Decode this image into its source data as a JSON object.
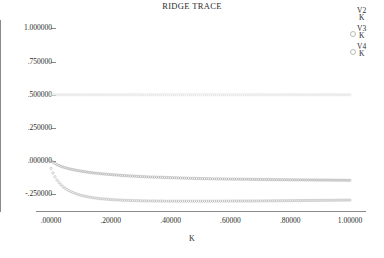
{
  "chart_data": {
    "type": "scatter",
    "title": "RIDGE TRACE",
    "xlabel": "K",
    "ylabel": "",
    "xlim": [
      0.0,
      1.0
    ],
    "ylim": [
      -0.375,
      1.0625
    ],
    "grid": false,
    "legend_position": "top-right",
    "xticks": [
      {
        "value": 0.0,
        "label": ".00000"
      },
      {
        "value": 0.2,
        "label": ".20000"
      },
      {
        "value": 0.4,
        "label": ".40000"
      },
      {
        "value": 0.6,
        "label": ".60000"
      },
      {
        "value": 0.8,
        "label": ".80000"
      },
      {
        "value": 1.0,
        "label": "1.00000"
      }
    ],
    "yticks": [
      {
        "value": 1.0,
        "label": "1.000000"
      },
      {
        "value": 0.75,
        "label": ".750000"
      },
      {
        "value": 0.5,
        "label": ".500000"
      },
      {
        "value": 0.25,
        "label": ".250000"
      },
      {
        "value": 0.0,
        "label": ".000000"
      },
      {
        "value": -0.25,
        "label": "-.250000"
      }
    ],
    "marker": "open-circle",
    "series": [
      {
        "name": "V2",
        "denominator": "K",
        "color": "#b0b0b0",
        "x": [
          0.0,
          0.01,
          0.02,
          0.03,
          0.04,
          0.05,
          0.06,
          0.07,
          0.08,
          0.09,
          0.1,
          0.12,
          0.14,
          0.16,
          0.18,
          0.2,
          0.24,
          0.28,
          0.32,
          0.36,
          0.4,
          0.45,
          0.5,
          0.55,
          0.6,
          0.65,
          0.7,
          0.75,
          0.8,
          0.85,
          0.9,
          0.95,
          1.0
        ],
        "values": [
          0.005,
          -0.013,
          -0.026,
          -0.036,
          -0.044,
          -0.051,
          -0.057,
          -0.062,
          -0.067,
          -0.071,
          -0.075,
          -0.082,
          -0.088,
          -0.093,
          -0.097,
          -0.101,
          -0.108,
          -0.113,
          -0.118,
          -0.121,
          -0.124,
          -0.128,
          -0.131,
          -0.133,
          -0.135,
          -0.136,
          -0.138,
          -0.139,
          -0.14,
          -0.141,
          -0.142,
          -0.143,
          -0.144
        ]
      },
      {
        "name": "V3",
        "denominator": "K",
        "color": "#bdbdbd",
        "x": [
          0.0,
          0.01,
          0.02,
          0.03,
          0.04,
          0.05,
          0.06,
          0.07,
          0.08,
          0.09,
          0.1,
          0.12,
          0.14,
          0.16,
          0.18,
          0.2,
          0.24,
          0.28,
          0.32,
          0.36,
          0.4,
          0.45,
          0.5,
          0.55,
          0.6,
          0.65,
          0.7,
          0.75,
          0.8,
          0.85,
          0.9,
          0.95,
          1.0
        ],
        "values": [
          -0.055,
          -0.105,
          -0.142,
          -0.17,
          -0.192,
          -0.209,
          -0.222,
          -0.233,
          -0.242,
          -0.25,
          -0.257,
          -0.267,
          -0.275,
          -0.281,
          -0.285,
          -0.289,
          -0.294,
          -0.297,
          -0.299,
          -0.3,
          -0.301,
          -0.301,
          -0.301,
          -0.301,
          -0.3,
          -0.3,
          -0.299,
          -0.298,
          -0.297,
          -0.296,
          -0.295,
          -0.294,
          -0.293
        ]
      },
      {
        "name": "V4",
        "denominator": "K",
        "color": "#e2e2e2",
        "x": [
          0.0,
          0.05,
          0.1,
          0.2,
          0.3,
          0.4,
          0.5,
          0.6,
          0.7,
          0.8,
          0.9,
          1.0
        ],
        "values": [
          0.5,
          0.5,
          0.5,
          0.5,
          0.5,
          0.5,
          0.5,
          0.5,
          0.5,
          0.5,
          0.5,
          0.5
        ]
      }
    ]
  },
  "legend": {
    "entries": [
      {
        "label": "V2",
        "denominator": "K",
        "has_marker": false
      },
      {
        "label": "V3",
        "denominator": "K",
        "has_marker": true
      },
      {
        "label": "V4",
        "denominator": "K",
        "has_marker": true
      }
    ]
  }
}
